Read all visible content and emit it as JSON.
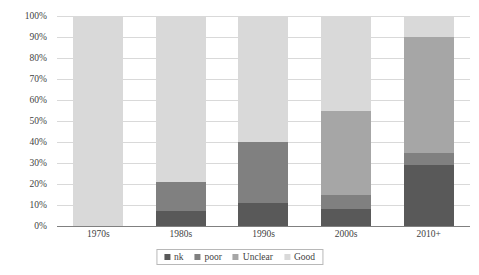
{
  "chart_data": {
    "type": "bar",
    "subtype": "100% stacked column",
    "title": "",
    "subtitle": "",
    "xlabel": "",
    "ylabel": "",
    "categories": [
      "1970s",
      "1980s",
      "1990s",
      "2000s",
      "2010+"
    ],
    "series": [
      {
        "name": "nk",
        "color": "#595959",
        "values": [
          0,
          7,
          11,
          8,
          29
        ]
      },
      {
        "name": "poor",
        "color": "#808080",
        "values": [
          0,
          14,
          29,
          7,
          6
        ]
      },
      {
        "name": "Unclear",
        "color": "#a6a6a6",
        "values": [
          0,
          0,
          0,
          40,
          55
        ]
      },
      {
        "name": "Good",
        "color": "#d9d9d9",
        "values": [
          100,
          79,
          60,
          45,
          10
        ]
      }
    ],
    "ylim": [
      0,
      100
    ],
    "ytick_values": [
      0,
      10,
      20,
      30,
      40,
      50,
      60,
      70,
      80,
      90,
      100
    ],
    "ytick_labels": [
      "0%",
      "10%",
      "20%",
      "30%",
      "40%",
      "50%",
      "60%",
      "70%",
      "80%",
      "90%",
      "100%"
    ],
    "grid": true,
    "grid_axis": "y",
    "grid_color": "#d9d9d9",
    "axis_line_color": "#808080",
    "legend": {
      "position": "bottom",
      "bordered": true,
      "entries": [
        {
          "label": "nk",
          "color": "#595959"
        },
        {
          "label": "poor",
          "color": "#808080"
        },
        {
          "label": "Unclear",
          "color": "#a6a6a6"
        },
        {
          "label": "Good",
          "color": "#d9d9d9"
        }
      ]
    },
    "background_color": "#ffffff",
    "text_color": "#3f3f3f"
  }
}
